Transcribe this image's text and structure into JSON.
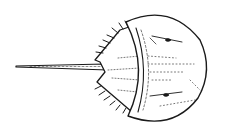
{
  "image": {
    "subject": "horseshoe crab line drawing",
    "style": "black ink sketch on white",
    "colors": {
      "ink": "#1a1a1a",
      "background": "#ffffff"
    }
  }
}
